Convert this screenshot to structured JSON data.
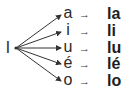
{
  "diagram": {
    "root": "l",
    "arrow_glyph": "→",
    "rows": [
      {
        "vowel": "a",
        "result": "la"
      },
      {
        "vowel": "i",
        "result": "li"
      },
      {
        "vowel": "u",
        "result": "lu"
      },
      {
        "vowel": "é",
        "result": "lé"
      },
      {
        "vowel": "o",
        "result": "lo"
      }
    ]
  }
}
